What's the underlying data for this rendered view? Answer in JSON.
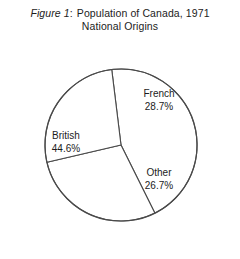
{
  "figure": {
    "label": "Figure 1",
    "colon": ":",
    "title_line1": "Population of Canada, 1971",
    "title_line2": "National Origins"
  },
  "chart_data": {
    "type": "pie",
    "subtitle": "National Origins",
    "categories": [
      "British",
      "French",
      "Other"
    ],
    "values": [
      44.6,
      28.7,
      26.7
    ],
    "value_suffix": "%",
    "legend": "none",
    "grid": false,
    "start_angle_deg": -7,
    "direction": "clockwise",
    "stroke_color": "#4a4a4a",
    "fill_color": "#ffffff",
    "slices": [
      {
        "name": "British",
        "value": 44.6,
        "display": "44.6%",
        "label_position": "inside-left"
      },
      {
        "name": "French",
        "value": 28.7,
        "display": "28.7%",
        "label_position": "inside-top-right"
      },
      {
        "name": "Other",
        "value": 26.7,
        "display": "26.7%",
        "label_position": "inside-bottom-right"
      }
    ]
  },
  "labels": {
    "french": {
      "name": "French",
      "value": "28.7%"
    },
    "british": {
      "name": "British",
      "value": "44.6%"
    },
    "other": {
      "name": "Other",
      "value": "26.7%"
    }
  }
}
